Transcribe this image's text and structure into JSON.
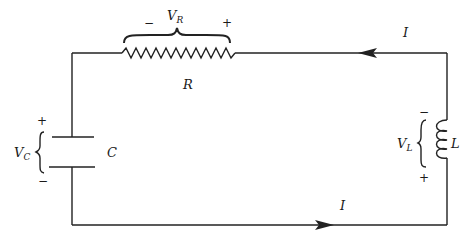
{
  "diagram": {
    "type": "series RLC circuit",
    "colors": {
      "wire": "#222222",
      "background": "#ffffff"
    },
    "resistor": {
      "label": "R",
      "voltage_label": {
        "main": "V",
        "sub": "R"
      },
      "minus": "−",
      "plus": "+"
    },
    "capacitor": {
      "label": "C",
      "voltage_label": {
        "main": "V",
        "sub": "C"
      },
      "plus": "+",
      "minus": "−"
    },
    "inductor": {
      "label": "L",
      "voltage_label": {
        "main": "V",
        "sub": "L"
      },
      "minus": "−",
      "plus": "+"
    },
    "current": {
      "top_label": "I",
      "top_direction": "left",
      "bottom_label": "I",
      "bottom_direction": "right"
    }
  }
}
